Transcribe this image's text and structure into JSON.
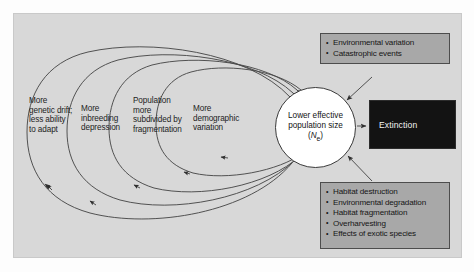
{
  "figure": {
    "panel_bg": "#d8d8d8",
    "box_bg": "#a8a8a8",
    "extinction_bg": "#131313",
    "stroke": "#3a3a3a"
  },
  "vortex_labels": [
    {
      "id": "genetic",
      "text": "More genetic drift; less ability to adapt"
    },
    {
      "id": "inbreeding",
      "text": "More inbreeding depression"
    },
    {
      "id": "subdivided",
      "text": "Population more subdivided by fragmentation"
    },
    {
      "id": "demographic",
      "text": "More demographic variation"
    }
  ],
  "core": {
    "line1": "Lower effective",
    "line2": "population size",
    "symbol_open": "(",
    "symbol_n": "N",
    "symbol_sub": "e",
    "symbol_close": ")"
  },
  "top_box": {
    "items": [
      "Environmental variation",
      "Catastrophic events"
    ]
  },
  "bottom_box": {
    "items": [
      "Habitat destruction",
      "Environmental degradation",
      "Habitat fragmentation",
      "Overharvesting",
      "Effects of exotic species"
    ]
  },
  "extinction": {
    "label": "Extinction"
  }
}
